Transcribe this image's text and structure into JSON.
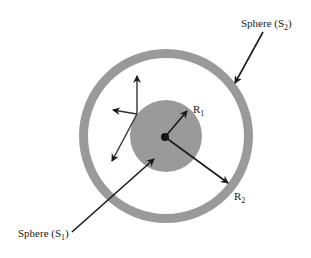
{
  "diagram": {
    "type": "concentric-spheres",
    "colors": {
      "shell": "#9a9a9a",
      "inner_sphere": "#9a9a9a",
      "arrow": "#1a1a1a",
      "background": "#ffffff"
    },
    "outer_sphere": {
      "label_main": "Sphere (S",
      "label_sub": "2",
      "label_close": ")"
    },
    "inner_sphere": {
      "label_main": "Sphere (S",
      "label_sub": "1",
      "label_close": ")"
    },
    "radius_labels": {
      "r1_main": "R",
      "r1_sub": "1",
      "r2_main": "R",
      "r2_sub": "2"
    }
  }
}
